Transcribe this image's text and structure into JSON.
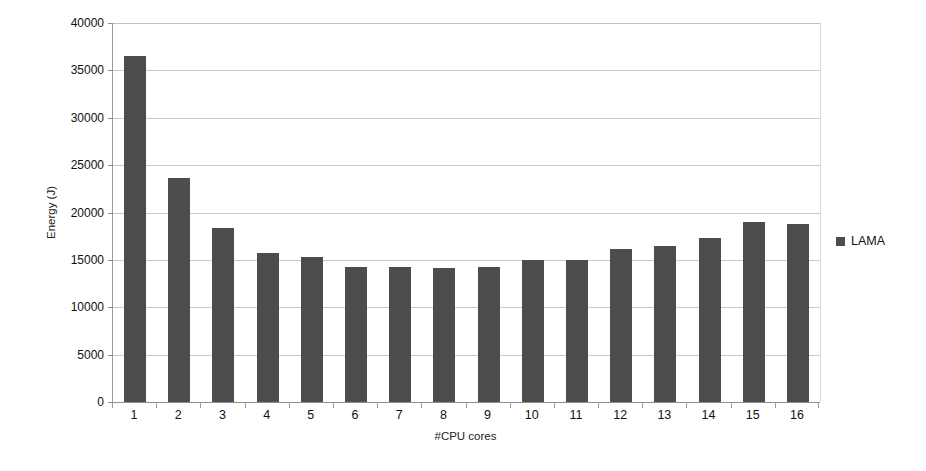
{
  "chart_data": {
    "type": "bar",
    "title": "",
    "xlabel": "#CPU cores",
    "ylabel": "Energy (J)",
    "categories": [
      "1",
      "2",
      "3",
      "4",
      "5",
      "6",
      "7",
      "8",
      "9",
      "10",
      "11",
      "12",
      "13",
      "14",
      "15",
      "16"
    ],
    "series": [
      {
        "name": "LAMA",
        "color": "#4d4d4d",
        "values": [
          36500,
          23600,
          18400,
          15700,
          15300,
          14300,
          14300,
          14100,
          14300,
          15000,
          15000,
          16200,
          16500,
          17300,
          19000,
          18800
        ]
      }
    ],
    "ylim": [
      0,
      40000
    ],
    "y_ticks": [
      0,
      5000,
      10000,
      15000,
      20000,
      25000,
      30000,
      35000,
      40000
    ],
    "y_tick_labels": [
      "0",
      "5000",
      "10000",
      "15000",
      "20000",
      "25000",
      "30000",
      "35000",
      "40000"
    ],
    "grid": true,
    "grid_axis": "y",
    "legend": {
      "position": "right",
      "entries": [
        {
          "label": "LAMA",
          "marker": "square",
          "color": "#4d4d4d"
        }
      ]
    }
  }
}
